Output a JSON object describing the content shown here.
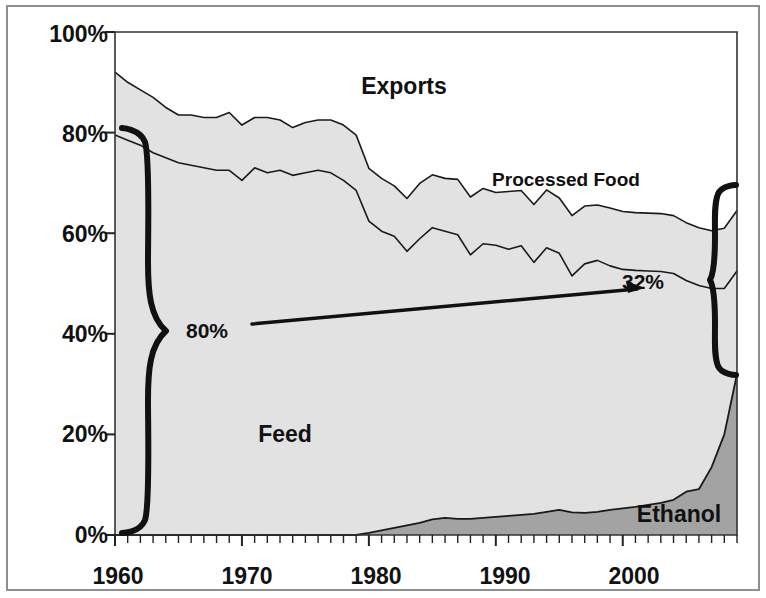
{
  "chart_data": {
    "type": "area",
    "title": "",
    "subtitle": "",
    "xlabel": "",
    "ylabel": "",
    "stacked": true,
    "grid": false,
    "legend_position": "inline-annotations",
    "xlim": [
      1960,
      2009
    ],
    "ylim": [
      0,
      100
    ],
    "y_tick_labels": [
      "0%",
      "20%",
      "40%",
      "60%",
      "80%",
      "100%"
    ],
    "y_ticks": [
      0,
      20,
      40,
      60,
      80,
      100
    ],
    "x_tick_labels": [
      "1960",
      "1970",
      "1980",
      "1990",
      "2000"
    ],
    "x_ticks": [
      1960,
      1970,
      1980,
      1990,
      2000
    ],
    "x_minor_tick_interval": 1,
    "series": [
      {
        "name": "Ethanol",
        "fill": "#a3a3a3",
        "values": [
          0,
          0,
          0,
          0,
          0,
          0,
          0,
          0,
          0,
          0,
          0,
          0,
          0,
          0,
          0,
          0,
          0,
          0,
          0,
          0,
          0.4,
          0.9,
          1.4,
          1.9,
          2.4,
          3.1,
          3.4,
          3.2,
          3.2,
          3.4,
          3.6,
          3.8,
          4.0,
          4.2,
          4.6,
          5.0,
          4.5,
          4.4,
          4.6,
          5.0,
          5.3,
          5.6,
          6.0,
          6.4,
          7.0,
          8.6,
          9.1,
          13.5,
          20.0,
          32.0
        ]
      },
      {
        "name": "Feed",
        "fill": "#e2e2e2",
        "values": [
          79.5,
          78.5,
          77.5,
          76.0,
          75.0,
          74.0,
          73.5,
          73.0,
          72.5,
          72.5,
          70.5,
          73.0,
          72.0,
          72.5,
          71.5,
          72.0,
          72.5,
          72.0,
          70.5,
          68.5,
          62.0,
          59.5,
          58.0,
          54.5,
          56.5,
          58.0,
          57.0,
          56.5,
          52.5,
          54.5,
          54.0,
          53.0,
          53.5,
          50.0,
          52.5,
          51.0,
          47.0,
          49.5,
          50.0,
          48.5,
          47.5,
          47.0,
          46.5,
          46.0,
          45.0,
          42.0,
          40.5,
          35.5,
          29.0,
          20.5
        ]
      },
      {
        "name": "Processed Food",
        "fill": "#e2e2e2",
        "values": [
          12.5,
          11.5,
          11.0,
          11.0,
          10.0,
          9.5,
          10.0,
          10.0,
          10.5,
          11.5,
          11.0,
          10.0,
          11.0,
          10.0,
          9.5,
          10.0,
          10.0,
          10.5,
          11.0,
          11.0,
          10.5,
          10.5,
          10.0,
          10.5,
          11.0,
          10.5,
          10.5,
          11.0,
          11.5,
          11.0,
          10.5,
          11.5,
          11.0,
          11.5,
          11.5,
          11.0,
          12.0,
          11.5,
          11.0,
          11.5,
          11.5,
          11.5,
          11.5,
          11.5,
          11.5,
          11.5,
          11.5,
          11.5,
          12.0,
          12.0
        ]
      },
      {
        "name": "Exports",
        "fill": "#ffffff",
        "values": [
          8.0,
          10.0,
          11.5,
          13.0,
          15.0,
          16.5,
          16.5,
          17.0,
          17.0,
          16.0,
          18.5,
          17.0,
          17.0,
          17.5,
          19.0,
          18.0,
          17.5,
          17.5,
          18.5,
          20.5,
          27.1,
          29.1,
          30.6,
          33.1,
          30.1,
          28.4,
          29.1,
          29.3,
          32.8,
          31.1,
          31.9,
          31.7,
          31.5,
          34.3,
          31.4,
          33.0,
          36.5,
          34.6,
          34.4,
          35.0,
          35.7,
          35.9,
          36.0,
          36.1,
          36.5,
          37.9,
          38.9,
          39.5,
          39.0,
          35.5
        ]
      }
    ],
    "annotations": [
      {
        "name": "left-brace-label",
        "text": "80%",
        "description": "Feed share of corn use in 1960"
      },
      {
        "name": "right-brace-label",
        "text": "32%",
        "description": "Ethanol share of corn use in 2009"
      },
      {
        "name": "exports-label",
        "text": "Exports"
      },
      {
        "name": "processed-food-label",
        "text": "Processed Food"
      },
      {
        "name": "feed-label",
        "text": "Feed"
      },
      {
        "name": "ethanol-label",
        "text": "Ethanol"
      }
    ],
    "colors": {
      "ethanol_fill": "#a3a3a3",
      "feed_fill": "#e2e2e2",
      "processed_food_fill": "#e2e2e2",
      "exports_fill": "#ffffff",
      "line": "#1a1a1a",
      "text": "#111111",
      "frame": "#8e8e8e"
    }
  },
  "axes": {
    "y_labels": [
      {
        "text": "100%",
        "value": 100
      },
      {
        "text": "80%",
        "value": 80
      },
      {
        "text": "60%",
        "value": 60
      },
      {
        "text": "40%",
        "value": 40
      },
      {
        "text": "20%",
        "value": 20
      },
      {
        "text": "0%",
        "value": 0
      }
    ],
    "x_labels": [
      {
        "text": "1960",
        "value": 1960
      },
      {
        "text": "1970",
        "value": 1970
      },
      {
        "text": "1980",
        "value": 1980
      },
      {
        "text": "1990",
        "value": 1990
      },
      {
        "text": "2000",
        "value": 2000
      }
    ]
  },
  "labels": {
    "exports": "Exports",
    "processed_food": "Processed Food",
    "feed": "Feed",
    "ethanol": "Ethanol",
    "brace_left": "80%",
    "brace_right": "32%",
    "y_100": "100%",
    "y_80": "80%",
    "y_60": "60%",
    "y_40": "40%",
    "y_20": "20%",
    "y_0": "0%",
    "x_1960": "1960",
    "x_1970": "1970",
    "x_1980": "1980",
    "x_1990": "1990",
    "x_2000": "2000"
  }
}
